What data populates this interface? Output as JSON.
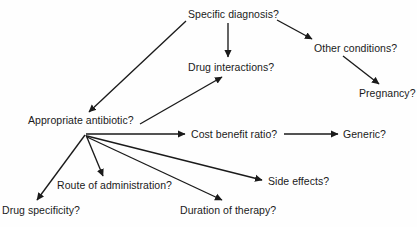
{
  "diagram": {
    "type": "flow-diagram",
    "title": "",
    "background_color": "#fefefe",
    "line_color": "#1a1a1a",
    "text_color": "#1a1a1a",
    "nodes": [
      {
        "id": "specific-diagnosis",
        "label": "Specific diagnosis?",
        "x": 188,
        "y": 8
      },
      {
        "id": "other-conditions",
        "label": "Other conditions?",
        "x": 314,
        "y": 42
      },
      {
        "id": "pregnancy",
        "label": "Pregnancy?",
        "x": 359,
        "y": 87
      },
      {
        "id": "drug-interactions",
        "label": "Drug interactions?",
        "x": 188,
        "y": 61
      },
      {
        "id": "appropriate-antibiotic",
        "label": "Appropriate antibiotic?",
        "x": 28,
        "y": 114
      },
      {
        "id": "cost-benefit-ratio",
        "label": "Cost benefit ratio?",
        "x": 191,
        "y": 128
      },
      {
        "id": "generic",
        "label": "Generic?",
        "x": 343,
        "y": 128
      },
      {
        "id": "route-of-administration",
        "label": "Route of administration?",
        "x": 57,
        "y": 179
      },
      {
        "id": "side-effects",
        "label": "Side effects?",
        "x": 268,
        "y": 175
      },
      {
        "id": "drug-specificity",
        "label": "Drug specificity?",
        "x": 2,
        "y": 204
      },
      {
        "id": "duration-of-therapy",
        "label": "Duration of therapy?",
        "x": 180,
        "y": 204
      }
    ],
    "edges": [
      {
        "id": "edge-diagnosis-to-interactions",
        "from": "specific-diagnosis",
        "to": "drug-interactions",
        "x1": 228,
        "y1": 23,
        "x2": 228,
        "y2": 57
      },
      {
        "id": "edge-diagnosis-to-antibiotic",
        "from": "specific-diagnosis",
        "to": "appropriate-antibiotic",
        "x1": 186,
        "y1": 21,
        "x2": 89,
        "y2": 112
      },
      {
        "id": "edge-diagnosis-to-other",
        "from": "specific-diagnosis",
        "to": "other-conditions",
        "x1": 277,
        "y1": 20,
        "x2": 312,
        "y2": 39
      },
      {
        "id": "edge-other-to-pregnancy",
        "from": "other-conditions",
        "to": "pregnancy",
        "x1": 343,
        "y1": 56,
        "x2": 379,
        "y2": 84
      },
      {
        "id": "edge-antibiotic-to-interactions",
        "from": "appropriate-antibiotic",
        "to": "drug-interactions",
        "x1": 140,
        "y1": 124,
        "x2": 222,
        "y2": 77
      },
      {
        "id": "edge-antibiotic-to-cost",
        "from": "appropriate-antibiotic",
        "to": "cost-benefit-ratio",
        "x1": 86,
        "y1": 134,
        "x2": 185,
        "y2": 134
      },
      {
        "id": "edge-cost-to-generic",
        "from": "cost-benefit-ratio",
        "to": "generic",
        "x1": 284,
        "y1": 134,
        "x2": 338,
        "y2": 134
      },
      {
        "id": "edge-antibiotic-to-route",
        "from": "appropriate-antibiotic",
        "to": "route-of-administration",
        "x1": 86,
        "y1": 135,
        "x2": 103,
        "y2": 176
      },
      {
        "id": "edge-antibiotic-to-specificity",
        "from": "appropriate-antibiotic",
        "to": "drug-specificity",
        "x1": 85,
        "y1": 135,
        "x2": 37,
        "y2": 200
      },
      {
        "id": "edge-antibiotic-to-duration",
        "from": "appropriate-antibiotic",
        "to": "duration-of-therapy",
        "x1": 87,
        "y1": 137,
        "x2": 222,
        "y2": 200
      },
      {
        "id": "edge-antibiotic-to-side-effects",
        "from": "appropriate-antibiotic",
        "to": "side-effects",
        "x1": 87,
        "y1": 136,
        "x2": 262,
        "y2": 180
      }
    ]
  }
}
